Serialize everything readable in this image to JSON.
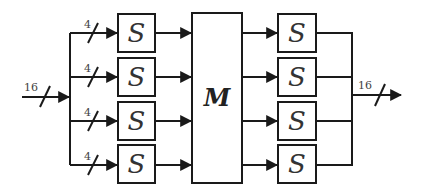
{
  "diagram": {
    "input": {
      "width_label": "16"
    },
    "branches": [
      {
        "width_label": "4",
        "sbox_label": "S"
      },
      {
        "width_label": "4",
        "sbox_label": "S"
      },
      {
        "width_label": "4",
        "sbox_label": "S"
      },
      {
        "width_label": "4",
        "sbox_label": "S"
      }
    ],
    "mixing_box": {
      "label": "M"
    },
    "output_sboxes": [
      {
        "label": "S"
      },
      {
        "label": "S"
      },
      {
        "label": "S"
      },
      {
        "label": "S"
      }
    ],
    "output": {
      "width_label": "16"
    }
  }
}
